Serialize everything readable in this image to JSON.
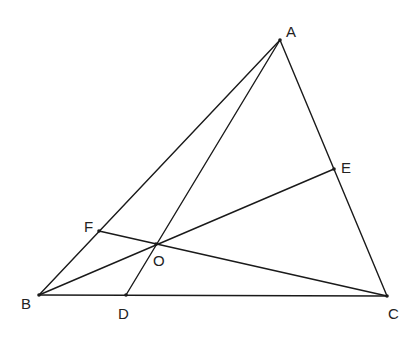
{
  "diagram": {
    "type": "geometry",
    "points": {
      "A": {
        "label": "A",
        "x": 280,
        "y": 40,
        "label_x": 286,
        "label_y": 37
      },
      "B": {
        "label": "B",
        "x": 39,
        "y": 295,
        "label_x": 21,
        "label_y": 309
      },
      "C": {
        "label": "C",
        "x": 387,
        "y": 296,
        "label_x": 388,
        "label_y": 319
      },
      "D": {
        "label": "D",
        "x": 126,
        "y": 295,
        "label_x": 118,
        "label_y": 319
      },
      "E": {
        "label": "E",
        "x": 334,
        "y": 169,
        "label_x": 341,
        "label_y": 173
      },
      "F": {
        "label": "F",
        "x": 99,
        "y": 231,
        "label_x": 84,
        "label_y": 232
      },
      "O": {
        "label": "O",
        "x": 156,
        "y": 244,
        "label_x": 153,
        "label_y": 266
      }
    },
    "segments": [
      {
        "name": "AB",
        "from": "A",
        "to": "B"
      },
      {
        "name": "BC",
        "from": "B",
        "to": "C"
      },
      {
        "name": "CA",
        "from": "C",
        "to": "A"
      },
      {
        "name": "AD",
        "from": "A",
        "to": "D"
      },
      {
        "name": "BE",
        "from": "B",
        "to": "E"
      },
      {
        "name": "CF",
        "from": "C",
        "to": "F"
      }
    ],
    "stroke_color": "#1a1a1a",
    "background": "#ffffff"
  }
}
